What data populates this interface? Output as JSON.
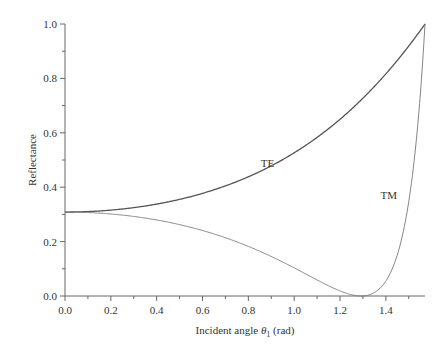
{
  "chart_data": {
    "type": "line",
    "title": "",
    "xlabel": "Incident angle θ1 (rad)",
    "xlabel_parts": {
      "prefix": "Incident angle ",
      "symbol": "θ",
      "sub": "1",
      "suffix": " (rad)"
    },
    "ylabel": "Reflectance",
    "xlim": [
      0,
      1.5708
    ],
    "ylim": [
      0,
      1.0
    ],
    "grid": false,
    "legend": "inline labels",
    "x_ticks": [
      "0.0",
      "0.2",
      "0.4",
      "0.6",
      "0.8",
      "1.0",
      "1.2",
      "1.4"
    ],
    "x_tick_values": [
      0,
      0.2,
      0.4,
      0.6,
      0.8,
      1.0,
      1.2,
      1.4
    ],
    "x_minor_ticks": [
      0.1,
      0.3,
      0.5,
      0.7,
      0.9,
      1.1,
      1.3,
      1.5
    ],
    "y_ticks": [
      "0.0",
      "0.2",
      "0.4",
      "0.6",
      "0.8",
      "1.0"
    ],
    "y_tick_values": [
      0,
      0.2,
      0.4,
      0.6,
      0.8,
      1.0
    ],
    "y_minor_ticks": [
      0.1,
      0.3,
      0.5,
      0.7,
      0.9
    ],
    "refractive_index": 3.5,
    "annotations": [
      {
        "text": "TE",
        "x": 0.92,
        "y": 0.49
      },
      {
        "text": "TM",
        "x": 1.42,
        "y": 0.37
      }
    ],
    "x": [
      0.0,
      0.2,
      0.4,
      0.6,
      0.8,
      1.0,
      1.2,
      1.29,
      1.4,
      1.5,
      1.5708
    ],
    "series": [
      {
        "name": "TE",
        "values": [
          0.309,
          0.314,
          0.33,
          0.36,
          0.409,
          0.484,
          0.601,
          0.667,
          0.77,
          0.888,
          1.0
        ],
        "style": "solid"
      },
      {
        "name": "TM",
        "values": [
          0.309,
          0.303,
          0.286,
          0.256,
          0.207,
          0.132,
          0.034,
          0.0,
          0.064,
          0.432,
          1.0
        ],
        "style": "thin"
      }
    ],
    "colors": {
      "TE": "#555555",
      "TM": "#777777",
      "axis": "#666666"
    }
  }
}
